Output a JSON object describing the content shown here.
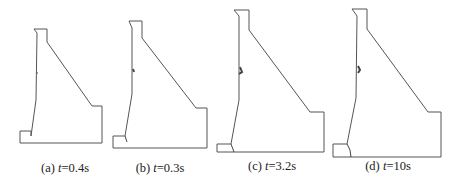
{
  "figure": {
    "panels": [
      {
        "id": "a",
        "prefix": "(a) ",
        "var": "t",
        "value": "=0.4s",
        "caption_x": 65,
        "caption_y": 161
      },
      {
        "id": "b",
        "prefix": "(b) ",
        "var": "t",
        "value": "=0.3s",
        "caption_x": 160,
        "caption_y": 161
      },
      {
        "id": "c",
        "prefix": "(c) ",
        "var": "t",
        "value": "=3.2s",
        "caption_x": 272,
        "caption_y": 159
      },
      {
        "id": "d",
        "prefix": "(d) ",
        "var": "t",
        "value": "=10s",
        "caption_x": 388,
        "caption_y": 159
      }
    ],
    "stroke_color": "#555555",
    "background": "#ffffff"
  }
}
